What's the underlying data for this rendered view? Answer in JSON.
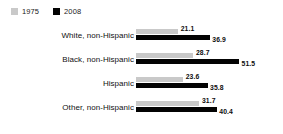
{
  "legend": {
    "entries": [
      {
        "label": "1975",
        "color": "#c9c9c9",
        "swatch_icon": "legend-swatch-square-gray"
      },
      {
        "label": "2008",
        "color": "#030303",
        "swatch_icon": "legend-swatch-square-black"
      }
    ]
  },
  "chart_data": {
    "type": "bar",
    "orientation": "horizontal",
    "title": "",
    "subtitle": "",
    "xlabel": "",
    "ylabel": "",
    "grid": false,
    "legend_position": "top-left",
    "xlim": [
      0,
      51.5
    ],
    "categories": [
      "White, non-Hispanic",
      "Black, non-Hispanic",
      "Hispanic",
      "Other, non-Hispanic"
    ],
    "series": [
      {
        "name": "1975",
        "color": "#c9c9c9",
        "values": [
          21.1,
          28.7,
          23.6,
          31.7
        ]
      },
      {
        "name": "2008",
        "color": "#030303",
        "values": [
          36.9,
          51.5,
          35.8,
          40.4
        ]
      }
    ],
    "value_labels": [
      [
        "21.1",
        "36.9"
      ],
      [
        "28.7",
        "51.5"
      ],
      [
        "23.6",
        "35.8"
      ],
      [
        "31.7",
        "40.4"
      ]
    ]
  }
}
